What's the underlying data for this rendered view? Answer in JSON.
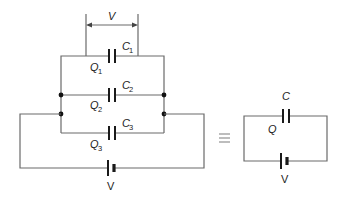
{
  "diagram": {
    "type": "circuit",
    "voltage_label": "V",
    "capacitors": [
      {
        "name": "C",
        "sub": "1",
        "charge": "Q",
        "charge_sub": "1"
      },
      {
        "name": "C",
        "sub": "2",
        "charge": "Q",
        "charge_sub": "2"
      },
      {
        "name": "C",
        "sub": "3",
        "charge": "Q",
        "charge_sub": "3"
      }
    ],
    "battery_label": "V",
    "equivalence_symbol": "≡",
    "equivalent": {
      "capacitor": "C",
      "charge": "Q",
      "battery_label": "V"
    },
    "colors": {
      "wire": "#6a6a6a",
      "component": "#1a1a1a"
    }
  }
}
